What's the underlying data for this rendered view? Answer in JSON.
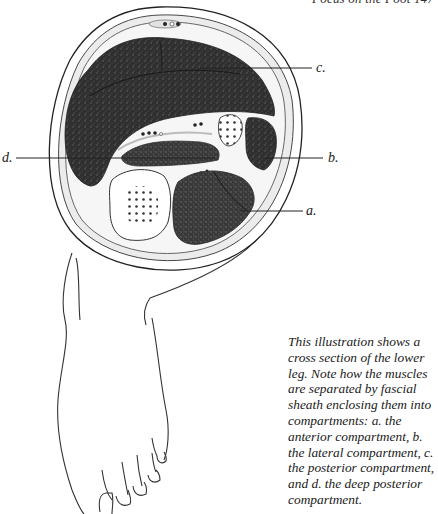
{
  "page": {
    "running_header": "Focus on the Foot 147"
  },
  "figure": {
    "labels": {
      "a": "a.",
      "b": "b.",
      "c": "c.",
      "d": "d."
    },
    "colors": {
      "muscle": "#2e2e2e",
      "fascia": "#d8d8d8",
      "bone": "#ffffff",
      "line": "#222222"
    }
  },
  "caption": {
    "text": "This illustration shows a cross section of the lower leg. Note how the muscles are separated by fascial sheath enclosing them into compartments: a. the anterior compartment, b. the lateral compartment, c. the posterior compartment, and d. the deep posterior compartment."
  }
}
